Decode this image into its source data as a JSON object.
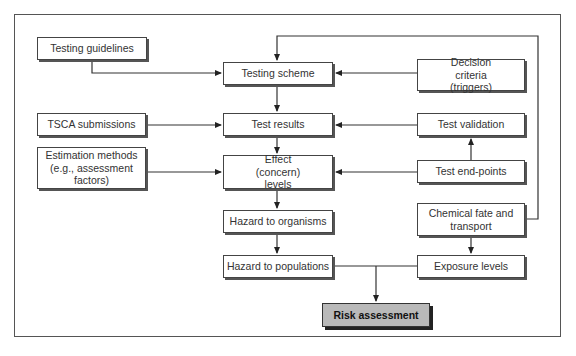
{
  "diagram": {
    "nodes": {
      "testing_guidelines": "Testing guidelines",
      "tsca_submissions": "TSCA submissions",
      "estimation_methods": "Estimation methods (e.g., assessment factors)",
      "testing_scheme": "Testing scheme",
      "test_results": "Test results",
      "effect_levels": "Effect (concern) levels",
      "hazard_organisms": "Hazard to organisms",
      "hazard_populations": "Hazard to populations",
      "decision_criteria": "Decision criteria (triggers)",
      "test_validation": "Test validation",
      "test_endpoints": "Test end-points",
      "chemical_fate": "Chemical fate and transport",
      "exposure_levels": "Exposure levels",
      "risk_assessment": "Risk assessment"
    },
    "edges": [
      {
        "from": "Testing guidelines",
        "to": "Testing scheme"
      },
      {
        "from": "Decision criteria (triggers)",
        "to": "Testing scheme"
      },
      {
        "from": "Chemical fate and transport",
        "to": "Testing scheme"
      },
      {
        "from": "Testing scheme",
        "to": "Test results"
      },
      {
        "from": "TSCA submissions",
        "to": "Test results"
      },
      {
        "from": "Test validation",
        "to": "Test results"
      },
      {
        "from": "Test end-points",
        "to": "Test validation"
      },
      {
        "from": "Test results",
        "to": "Effect (concern) levels"
      },
      {
        "from": "Estimation methods (e.g., assessment factors)",
        "to": "Effect (concern) levels"
      },
      {
        "from": "Test end-points",
        "to": "Effect (concern) levels"
      },
      {
        "from": "Effect (concern) levels",
        "to": "Hazard to organisms"
      },
      {
        "from": "Hazard to organisms",
        "to": "Hazard to populations"
      },
      {
        "from": "Chemical fate and transport",
        "to": "Exposure levels"
      },
      {
        "from": "Hazard to populations",
        "to": "Risk assessment"
      },
      {
        "from": "Exposure levels",
        "to": "Risk assessment"
      }
    ],
    "colors": {
      "risk_fill": "#b9b9b9",
      "line": "#333333"
    }
  }
}
